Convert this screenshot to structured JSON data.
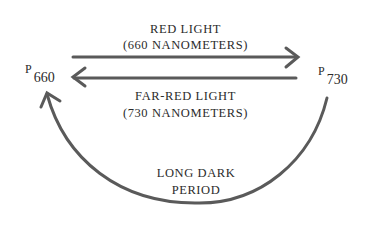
{
  "diagram": {
    "type": "phytochrome-cycle",
    "states": {
      "left": {
        "letter": "P",
        "subscript": "660"
      },
      "right": {
        "letter": "P",
        "subscript": "730"
      }
    },
    "arrows": [
      {
        "from": "P660",
        "to": "P730",
        "label_line1": "RED LIGHT",
        "label_line2": "(660 NANOMETERS)"
      },
      {
        "from": "P730",
        "to": "P660",
        "label_line1": "FAR-RED LIGHT",
        "label_line2": "(730 NANOMETERS)"
      },
      {
        "from": "P730",
        "to": "P660",
        "label_line1": "LONG DARK",
        "label_line2": "PERIOD"
      }
    ],
    "colors": {
      "arrow": "#555555",
      "text": "#2b2b2b",
      "background": "#ffffff"
    }
  }
}
